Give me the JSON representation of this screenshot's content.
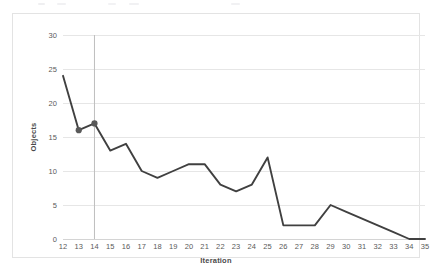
{
  "chart_data": {
    "type": "line",
    "title": "",
    "xlabel": "Iteration",
    "ylabel": "Objects",
    "x": [
      12,
      13,
      14,
      15,
      16,
      17,
      18,
      19,
      20,
      21,
      22,
      23,
      24,
      25,
      26,
      27,
      28,
      29,
      30,
      31,
      32,
      33,
      34,
      35
    ],
    "values": [
      24,
      16,
      17,
      13,
      14,
      10,
      9,
      10,
      11,
      11,
      8,
      7,
      8,
      12,
      2,
      2,
      2,
      5,
      4,
      3,
      2,
      1,
      0,
      0
    ],
    "series": [
      {
        "name": "Objects",
        "values": [
          24,
          16,
          17,
          13,
          14,
          10,
          9,
          10,
          11,
          11,
          8,
          7,
          8,
          12,
          2,
          2,
          2,
          5,
          4,
          3,
          2,
          1,
          0,
          0
        ]
      }
    ],
    "x_tick_labels": [
      "12",
      "13",
      "14",
      "15",
      "16",
      "17",
      "18",
      "19",
      "20",
      "21",
      "22",
      "23",
      "24",
      "25",
      "26",
      "27",
      "28",
      "29",
      "30",
      "31",
      "32",
      "33",
      "34",
      "35"
    ],
    "y_tick_labels": [
      "0",
      "5",
      "10",
      "15",
      "20",
      "25",
      "30"
    ],
    "y_ticks": [
      0,
      5,
      10,
      15,
      20,
      25,
      30
    ],
    "ylim": [
      0,
      30
    ],
    "xlim": [
      12,
      35
    ],
    "grid": true,
    "legend": false,
    "legend_position": "none",
    "markers": [
      {
        "x": 13,
        "y": 16,
        "label": "13"
      },
      {
        "x": 14,
        "y": 17,
        "label": "14"
      }
    ],
    "annotations": [
      {
        "kind": "vertical-reference-line",
        "x": 14,
        "y_from": 0,
        "y_to": 30
      }
    ],
    "colors": {
      "line": "#404040",
      "marker": "#595959",
      "gridline": "#e6e6e6",
      "axis": "#d4d4d4",
      "reference_line": "#bfbfbf",
      "tick_label": "#5a5a5a",
      "axis_title": "#4a4a4a",
      "frame": "#e3e3e3",
      "background": "#ffffff"
    }
  }
}
